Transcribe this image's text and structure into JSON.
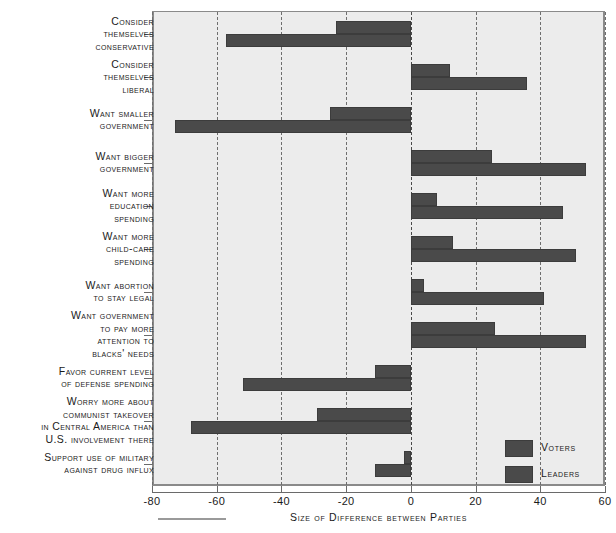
{
  "chart_data": {
    "type": "bar",
    "orientation": "horizontal",
    "title": "",
    "xlabel": "Size of Difference between Parties",
    "ylabel": "",
    "xlim": [
      -80,
      60
    ],
    "xticks": [
      -80,
      -60,
      -40,
      -20,
      0,
      20,
      40,
      60
    ],
    "xtick_labels": [
      "-80",
      "-60",
      "-40",
      "-20",
      "0",
      "20",
      "40",
      "60"
    ],
    "grid": true,
    "grid_axis": "x",
    "grid_style": "dashed",
    "legend_position": "inside-bottom-right",
    "categories": [
      "Consider themselves conservative",
      "Consider themselves liberal",
      "Want smaller government",
      "Want bigger government",
      "Want more education spending",
      "Want more child-care spending",
      "Want abortion to stay legal",
      "Want government to pay more attention to blacks' needs",
      "Favor current level of defense spending",
      "Worry more about communist takeover in Central America than U.S. involvement there",
      "Support use of military against drug influx"
    ],
    "category_label_lines": [
      [
        "Consider",
        "themselves",
        "conservative"
      ],
      [
        "Consider",
        "themselves",
        "liberal"
      ],
      [
        "Want smaller",
        "government"
      ],
      [
        "Want bigger",
        "government"
      ],
      [
        "Want more",
        "education",
        "spending"
      ],
      [
        "Want more",
        "child-care",
        "spending"
      ],
      [
        "Want abortion",
        "to stay legal"
      ],
      [
        "Want government",
        "to pay more",
        "attention to",
        "blacks' needs"
      ],
      [
        "Favor current level",
        "of defense spending"
      ],
      [
        "Worry more about",
        "communist takeover",
        "in Central America than",
        "U.S. involvement there"
      ],
      [
        "Support use of military",
        "against drug influx"
      ]
    ],
    "series": [
      {
        "name": "Voters",
        "color": "#4a4a4a",
        "values": [
          -23,
          12,
          -25,
          25,
          8,
          13,
          4,
          26,
          -11,
          -29,
          -2
        ]
      },
      {
        "name": "Leaders",
        "color": "#4a4a4a",
        "values": [
          -57,
          36,
          -73,
          54,
          47,
          51,
          41,
          54,
          -52,
          -68,
          -11
        ]
      }
    ]
  },
  "legend": {
    "entries": [
      {
        "label": "Voters",
        "color": "#4a4a4a"
      },
      {
        "label": "Leaders",
        "color": "#4a4a4a"
      }
    ]
  },
  "axis": {
    "x_title": "Size of Difference between Parties"
  },
  "colors": {
    "bar": "#4a4a4a",
    "plot_background": "#ececec",
    "gridline": "#6e6e6e",
    "axis": "#8a8a8a",
    "text": "#1a1a1a",
    "page_background": "#ffffff"
  }
}
